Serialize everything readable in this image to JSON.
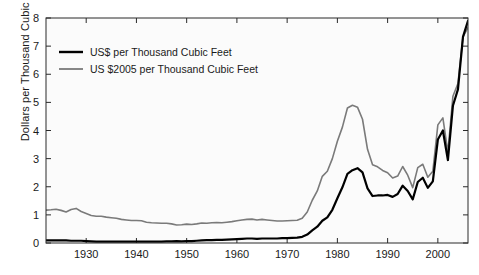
{
  "chart_data": {
    "type": "line",
    "title": "",
    "xlabel": "",
    "ylabel": "Dollars per Thousand Cubic Feet",
    "xlim": [
      1922,
      2006
    ],
    "ylim": [
      0,
      8
    ],
    "grid": false,
    "legend_position": "top-left",
    "xticks": [
      1930,
      1940,
      1950,
      1960,
      1970,
      1980,
      1990,
      2000
    ],
    "yticks": [
      0,
      1,
      2,
      3,
      4,
      5,
      6,
      7,
      8
    ],
    "xtick_labels": [
      "1930",
      "1940",
      "1950",
      "1960",
      "1970",
      "1980",
      "1990",
      "2000"
    ],
    "ytick_labels": [
      "0",
      "1",
      "2",
      "3",
      "4",
      "5",
      "6",
      "7",
      "8"
    ],
    "x": [
      1922,
      1923,
      1924,
      1925,
      1926,
      1927,
      1928,
      1929,
      1930,
      1931,
      1932,
      1933,
      1934,
      1935,
      1936,
      1937,
      1938,
      1939,
      1940,
      1941,
      1942,
      1943,
      1944,
      1945,
      1946,
      1947,
      1948,
      1949,
      1950,
      1951,
      1952,
      1953,
      1954,
      1955,
      1956,
      1957,
      1958,
      1959,
      1960,
      1961,
      1962,
      1963,
      1964,
      1965,
      1966,
      1967,
      1968,
      1969,
      1970,
      1971,
      1972,
      1973,
      1974,
      1975,
      1976,
      1977,
      1978,
      1979,
      1980,
      1981,
      1982,
      1983,
      1984,
      1985,
      1986,
      1987,
      1988,
      1989,
      1990,
      1991,
      1992,
      1993,
      1994,
      1995,
      1996,
      1997,
      1998,
      1999,
      2000,
      2001,
      2002,
      2003,
      2004,
      2005,
      2006
    ],
    "series": [
      {
        "name": "US$ per Thousand Cubic Feet",
        "color": "#000000",
        "width": 2.2,
        "values": [
          0.09,
          0.09,
          0.09,
          0.09,
          0.09,
          0.08,
          0.08,
          0.08,
          0.07,
          0.06,
          0.05,
          0.05,
          0.05,
          0.05,
          0.05,
          0.05,
          0.05,
          0.05,
          0.05,
          0.05,
          0.05,
          0.05,
          0.05,
          0.05,
          0.06,
          0.06,
          0.07,
          0.06,
          0.07,
          0.07,
          0.08,
          0.09,
          0.1,
          0.1,
          0.11,
          0.11,
          0.12,
          0.13,
          0.14,
          0.15,
          0.16,
          0.16,
          0.15,
          0.16,
          0.16,
          0.16,
          0.16,
          0.17,
          0.17,
          0.18,
          0.19,
          0.22,
          0.3,
          0.45,
          0.58,
          0.79,
          0.91,
          1.18,
          1.59,
          1.98,
          2.46,
          2.59,
          2.66,
          2.51,
          1.94,
          1.67,
          1.69,
          1.69,
          1.71,
          1.64,
          1.74,
          2.04,
          1.85,
          1.55,
          2.17,
          2.32,
          1.96,
          2.19,
          3.68,
          4.0,
          2.95,
          4.88,
          5.46,
          7.33,
          7.9
        ]
      },
      {
        "name": "US $2005 per Thousand Cubic Feet",
        "color": "#7a7a7a",
        "width": 1.6,
        "values": [
          1.17,
          1.18,
          1.2,
          1.16,
          1.1,
          1.19,
          1.23,
          1.12,
          1.05,
          0.98,
          0.95,
          0.95,
          0.92,
          0.9,
          0.88,
          0.84,
          0.82,
          0.8,
          0.8,
          0.79,
          0.74,
          0.72,
          0.71,
          0.7,
          0.7,
          0.68,
          0.64,
          0.65,
          0.67,
          0.66,
          0.68,
          0.71,
          0.7,
          0.72,
          0.73,
          0.72,
          0.74,
          0.76,
          0.79,
          0.82,
          0.84,
          0.85,
          0.82,
          0.84,
          0.82,
          0.8,
          0.78,
          0.78,
          0.79,
          0.8,
          0.81,
          0.88,
          1.1,
          1.52,
          1.85,
          2.37,
          2.55,
          3.0,
          3.62,
          4.12,
          4.8,
          4.9,
          4.83,
          4.4,
          3.33,
          2.78,
          2.71,
          2.58,
          2.5,
          2.31,
          2.38,
          2.72,
          2.41,
          1.97,
          2.68,
          2.8,
          2.34,
          2.55,
          4.2,
          4.45,
          3.22,
          5.22,
          5.67,
          7.33,
          7.66
        ]
      }
    ]
  },
  "axis": {
    "ylabel": "Dollars per Thousand Cubic Feet"
  },
  "legend": {
    "items": [
      {
        "label": "US$ per Thousand Cubic Feet",
        "color": "#000000"
      },
      {
        "label": "US $2005 per Thousand Cubic Feet",
        "color": "#7a7a7a"
      }
    ]
  },
  "style": {
    "plot_background": "#fbfbfb",
    "axis_color": "#2a2a2a",
    "figure_background": "#ffffff"
  }
}
